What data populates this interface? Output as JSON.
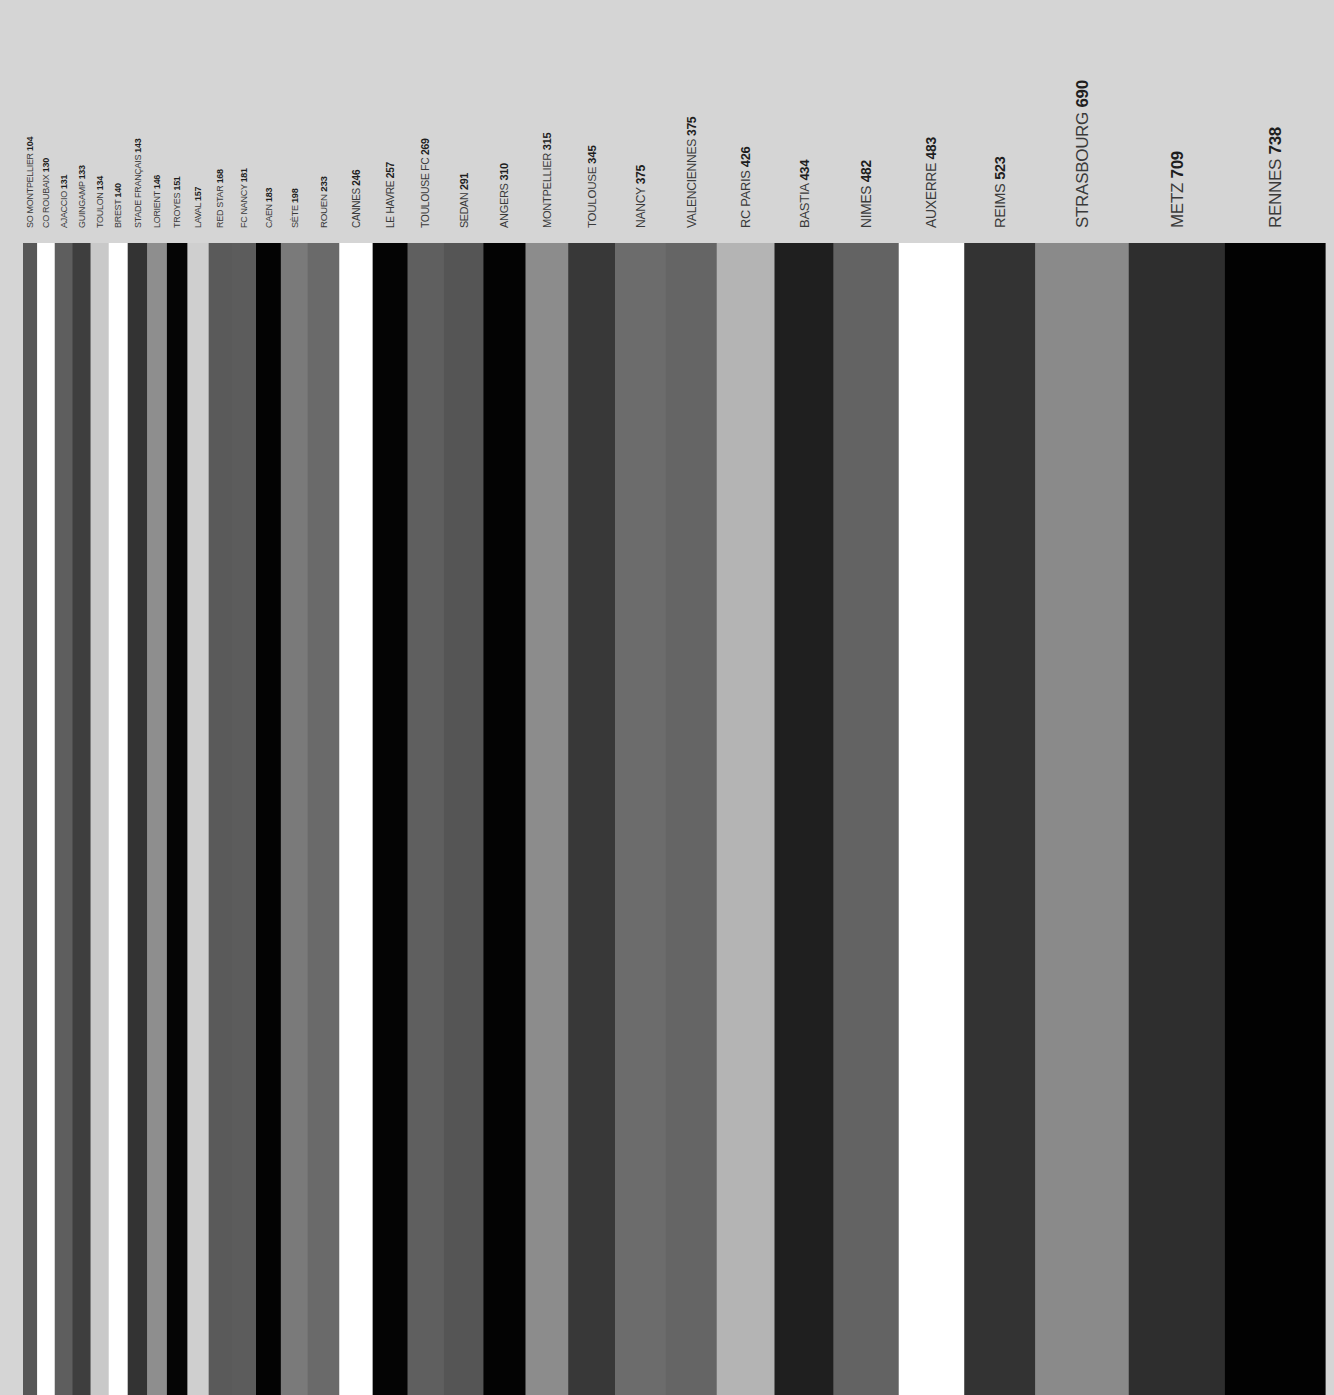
{
  "chart_data": {
    "type": "bar",
    "orientation": "vertical-stripes",
    "title": "",
    "xlabel": "",
    "ylabel": "",
    "legend": "none",
    "grid": false,
    "note": "Each club is a full-height stripe whose width is proportional to its value; labels are rotated above each stripe.",
    "categories": [
      "SO MONTPELLIER",
      "CO ROUBAIX",
      "AJACCIO",
      "GUINGAMP",
      "TOULON",
      "BREST",
      "STADE FRANÇAIS",
      "LORIENT",
      "TROYES",
      "LAVAL",
      "RED STAR",
      "FC NANCY",
      "CAEN",
      "SÈTE",
      "ROUEN",
      "CANNES",
      "LE HAVRE",
      "TOULOUSE FC",
      "SEDAN",
      "ANGERS",
      "MONTPELLIER",
      "TOULOUSE",
      "NANCY",
      "VALENCIENNES",
      "RC PARIS",
      "BASTIA",
      "NIMES",
      "AUXERRE",
      "REIMS",
      "STRASBOURG",
      "METZ",
      "RENNES"
    ],
    "values": [
      104,
      130,
      131,
      133,
      134,
      140,
      143,
      146,
      151,
      157,
      168,
      181,
      183,
      198,
      233,
      246,
      257,
      269,
      291,
      310,
      315,
      345,
      375,
      375,
      426,
      434,
      482,
      483,
      523,
      690,
      709,
      738
    ],
    "colors": [
      "#575757",
      "#ffffff",
      "#5e5e5e",
      "#3e3e3e",
      "#c9c9c9",
      "#ffffff",
      "#333333",
      "#8e8e8e",
      "#050505",
      "#cfcfcf",
      "#5a5a5a",
      "#5c5c5c",
      "#030303",
      "#7a7a7a",
      "#6a6a6a",
      "#ffffff",
      "#040404",
      "#5f5f5f",
      "#555555",
      "#030303",
      "#8c8c8c",
      "#383838",
      "#6c6c6c",
      "#656565",
      "#b4b4b4",
      "#1f1f1f",
      "#636363",
      "#ffffff",
      "#333333",
      "#8a8a8a",
      "#2e2e2e",
      "#020202"
    ]
  }
}
